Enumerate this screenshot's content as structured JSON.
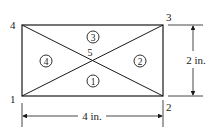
{
  "diagram": {
    "nodes": [
      {
        "id": "1",
        "label": "1"
      },
      {
        "id": "2",
        "label": "2"
      },
      {
        "id": "3",
        "label": "3"
      },
      {
        "id": "4",
        "label": "4"
      },
      {
        "id": "5",
        "label": "5"
      }
    ],
    "elements": [
      {
        "id": "1",
        "label": "1",
        "nodes": [
          "1",
          "2",
          "5"
        ]
      },
      {
        "id": "2",
        "label": "2",
        "nodes": [
          "2",
          "3",
          "5"
        ]
      },
      {
        "id": "3",
        "label": "3",
        "nodes": [
          "3",
          "4",
          "5"
        ]
      },
      {
        "id": "4",
        "label": "4",
        "nodes": [
          "4",
          "1",
          "5"
        ]
      }
    ],
    "dimensions": {
      "width_label": "4 in.",
      "height_label": "2 in."
    }
  }
}
